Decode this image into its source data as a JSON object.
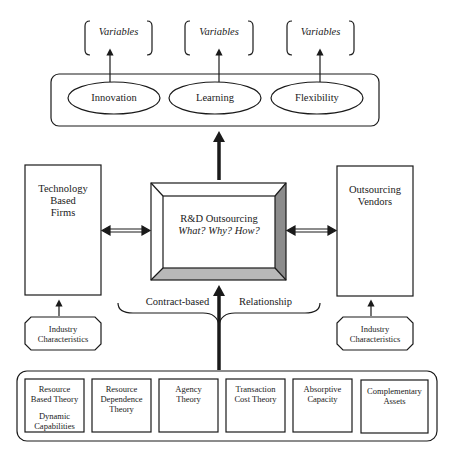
{
  "outcomes": {
    "variables": [
      "Variables",
      "Variables",
      "Variables"
    ],
    "ellipses": [
      "Innovation",
      "Learning",
      "Flexibility"
    ]
  },
  "left_box": {
    "lines": [
      "Technology",
      "Based",
      "Firms"
    ]
  },
  "center_box": {
    "title": "R&D Outsourcing",
    "subtitle": "What? Why? How?"
  },
  "right_box": {
    "lines": [
      "Outsourcing",
      "Vendors"
    ]
  },
  "relationship": {
    "left": "Contract-based",
    "right": "Relationship"
  },
  "industry": {
    "left": [
      "Industry",
      "Characteristics"
    ],
    "right": [
      "Industry",
      "Characteristics"
    ]
  },
  "theories": [
    {
      "lines": [
        "Resource",
        "Based Theory",
        "",
        "Dynamic",
        "Capabilities"
      ]
    },
    {
      "lines": [
        "Resource",
        "Dependence",
        "Theory"
      ]
    },
    {
      "lines": [
        "Agency",
        "Theory"
      ]
    },
    {
      "lines": [
        "Transaction",
        "Cost Theory"
      ]
    },
    {
      "lines": [
        "Absorptive",
        "Capacity"
      ]
    },
    {
      "lines": [
        "Complementary",
        "Assets"
      ]
    }
  ],
  "colors": {
    "line": "#1a1a1a",
    "bevel_dark": "#8c8c8c",
    "bevel_mid": "#b8b8b8"
  }
}
